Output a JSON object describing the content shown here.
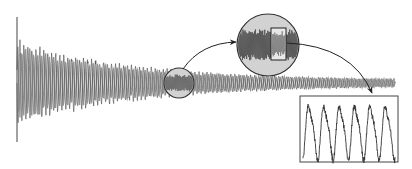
{
  "diagram": {
    "colors": {
      "background": "#ffffff",
      "waveform": "#555555",
      "waveform_light": "#8a8a8a",
      "circle_fill": "#d0d0d0",
      "circle_stroke": "#333333",
      "box_stroke": "#444444",
      "arrow": "#222222",
      "detail_trace": "#333333"
    },
    "waveform": {
      "x_start": 17,
      "x_end": 395,
      "center_y": 83,
      "initial_spike_top": 17,
      "initial_spike_bottom": 142,
      "envelope_start_half_height": 45,
      "envelope_end_half_height": 3,
      "cycles": 95
    },
    "small_magnifier": {
      "cx": 179,
      "cy": 83,
      "r": 15
    },
    "large_magnifier": {
      "cx": 268,
      "cy": 45,
      "r": 31
    },
    "inner_selection_rect": {
      "x": 271,
      "y": 28,
      "w": 15,
      "h": 32
    },
    "detail_box": {
      "x": 300,
      "y": 96,
      "w": 98,
      "h": 66
    },
    "detail_signal": {
      "peaks": 6,
      "description": "zoomed periodic signal with noise"
    },
    "arrows": [
      {
        "from": "small-magnifier",
        "to": "large-magnifier"
      },
      {
        "from": "inner-selection-rect",
        "to": "detail-box"
      }
    ]
  }
}
